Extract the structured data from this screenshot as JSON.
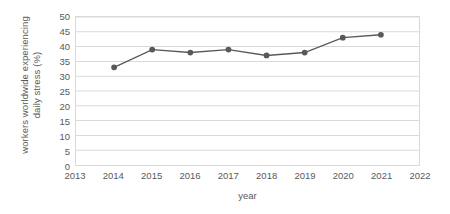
{
  "chart_data": {
    "type": "line",
    "title": "",
    "xlabel": "year",
    "ylabel_lines": [
      "workers worldwide experiencing",
      "daily stress (%)"
    ],
    "ylabel": "workers worldwide experiencing daily stress (%)",
    "x": [
      2014,
      2015,
      2016,
      2017,
      2018,
      2019,
      2020,
      2021
    ],
    "values": [
      33,
      39,
      38,
      39,
      37,
      38,
      43,
      44
    ],
    "xlim": [
      2013,
      2022
    ],
    "ylim": [
      0,
      50
    ],
    "x_ticks": [
      "2013",
      "2014",
      "2015",
      "2016",
      "2017",
      "2018",
      "2019",
      "2020",
      "2021",
      "2022"
    ],
    "y_ticks": [
      "0",
      "5",
      "10",
      "15",
      "20",
      "25",
      "30",
      "35",
      "40",
      "45",
      "50"
    ],
    "y_tick_step": 5,
    "grid": "horizontal",
    "legend": "none",
    "series_color": "#595959",
    "grid_color": "#d9d9d9",
    "marker": "circle",
    "text_color": "#595959"
  }
}
